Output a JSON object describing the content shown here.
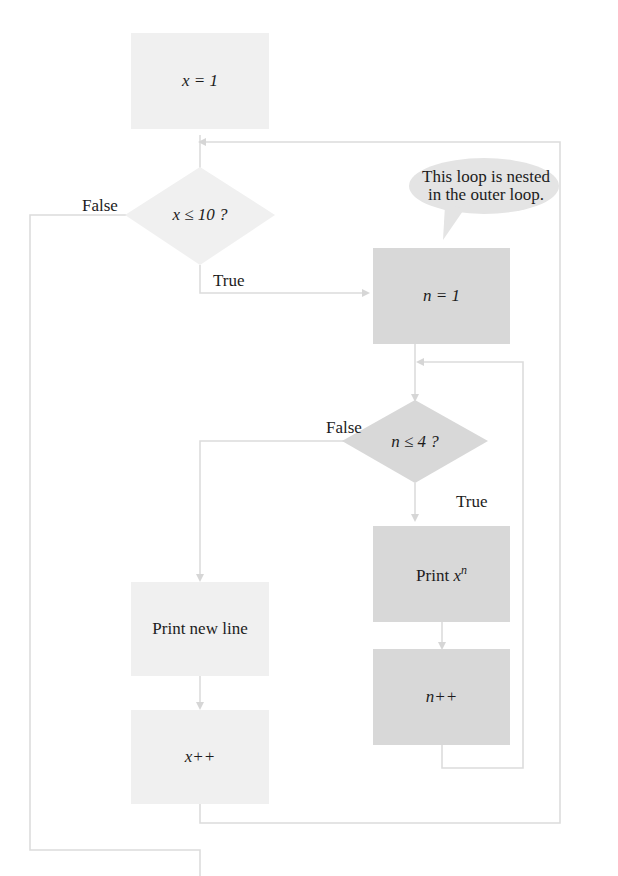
{
  "diagram": {
    "type": "flowchart",
    "title": "",
    "colors": {
      "outer_loop_fill": "#f0f0f0",
      "inner_loop_fill": "#d8d8d8",
      "connector": "#dcdcdc",
      "text": "#1c1c1c"
    },
    "nodes": {
      "init_x": {
        "text": "x = 1"
      },
      "cond_x": {
        "text": "x ≤ 10 ?"
      },
      "init_n": {
        "text": "n = 1"
      },
      "cond_n": {
        "text": "n ≤ 4 ?"
      },
      "print_xn": {
        "prefix": "Print ",
        "base": "x",
        "exponent": "n"
      },
      "inc_n": {
        "text": "n++"
      },
      "print_newline": {
        "text": "Print new line"
      },
      "inc_x": {
        "text": "x++"
      }
    },
    "labels": {
      "outer_false": "False",
      "outer_true": "True",
      "inner_false": "False",
      "inner_true": "True"
    },
    "callout": {
      "line1": "This loop is nested",
      "line2": "in the outer loop."
    },
    "edges": [
      {
        "from": "init_x",
        "to": "cond_x"
      },
      {
        "from": "cond_x",
        "to": "init_n",
        "label": "True"
      },
      {
        "from": "cond_x",
        "to": "exit",
        "label": "False"
      },
      {
        "from": "init_n",
        "to": "cond_n"
      },
      {
        "from": "cond_n",
        "to": "print_xn",
        "label": "True"
      },
      {
        "from": "cond_n",
        "to": "print_newline",
        "label": "False"
      },
      {
        "from": "print_xn",
        "to": "inc_n"
      },
      {
        "from": "inc_n",
        "to": "cond_n"
      },
      {
        "from": "print_newline",
        "to": "inc_x"
      },
      {
        "from": "inc_x",
        "to": "cond_x"
      }
    ]
  }
}
